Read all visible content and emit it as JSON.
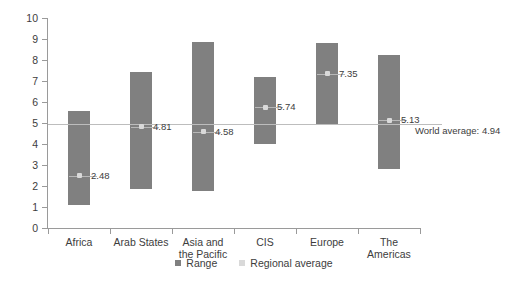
{
  "chart_data": {
    "type": "bar",
    "subtype": "floating-range-bar-with-average-markers",
    "title": "",
    "xlabel": "",
    "ylabel": "IDI 2016",
    "ylim": [
      0,
      10
    ],
    "ytick_values": [
      0,
      1,
      2,
      3,
      4,
      5,
      6,
      7,
      8,
      9,
      10
    ],
    "ytick_labels": [
      "0",
      "1",
      "2",
      "3",
      "4",
      "5",
      "6",
      "7",
      "8",
      "9",
      "10"
    ],
    "grid": false,
    "legend_position": "bottom-center",
    "categories": [
      "Africa",
      "Arab States",
      "Asia and\nthe Pacific",
      "CIS",
      "Europe",
      "The Americas"
    ],
    "series": [
      {
        "name": "Range",
        "type": "range",
        "color": "#808080",
        "low": [
          1.1,
          1.85,
          1.75,
          4.0,
          4.95,
          2.8
        ],
        "high": [
          5.55,
          7.45,
          8.85,
          7.2,
          8.8,
          8.25
        ]
      },
      {
        "name": "Regional average",
        "type": "marker",
        "color": "#d9d9d9",
        "values": [
          2.48,
          4.81,
          4.58,
          5.74,
          7.35,
          5.13
        ],
        "labels": [
          "2.48",
          "4.81",
          "4.58",
          "5.74",
          "7.35",
          "5.13"
        ]
      }
    ],
    "annotations": [
      {
        "name": "world-average",
        "label": "World average: 4.94",
        "value": 4.94,
        "type": "horizontal-line",
        "color": "#bdbdbd"
      }
    ]
  },
  "legend": {
    "items": [
      {
        "label": "Range",
        "color": "#808080"
      },
      {
        "label": "Regional average",
        "color": "#d9d9d9"
      }
    ]
  }
}
